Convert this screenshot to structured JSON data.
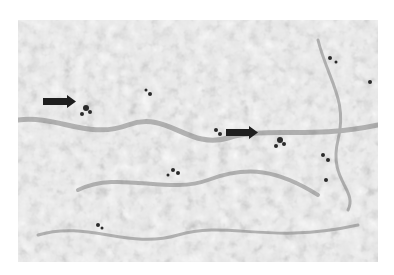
{
  "figure": {
    "type": "grayscale micrograph",
    "colors": {
      "background": "#ffffff",
      "tissue_light": "#e4e4e4",
      "tissue_mid": "#9a9a9a",
      "stain_dark": "#2a2a2a",
      "arrow": "#1e1e1e"
    },
    "arrows": [
      {
        "label": "arrow-left",
        "x": 43,
        "y": 95,
        "width": 33,
        "height": 13,
        "direction": "right"
      },
      {
        "label": "arrow-center",
        "x": 226,
        "y": 126,
        "width": 32,
        "height": 13,
        "direction": "right"
      }
    ]
  }
}
